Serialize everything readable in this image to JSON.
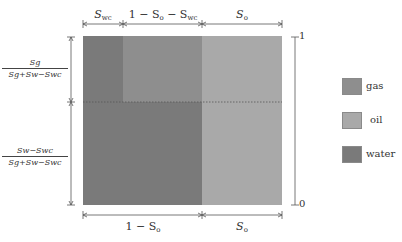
{
  "diagram": {
    "regions": [
      {
        "name": "water-top-left",
        "phase": "water"
      },
      {
        "name": "gas-top-middle",
        "phase": "gas"
      },
      {
        "name": "water-bottom-left",
        "phase": "water"
      },
      {
        "name": "oil-right",
        "phase": "oil"
      }
    ],
    "top_labels": {
      "swc": "S",
      "swc_sub": "wc",
      "middle_prefix": "1 − S",
      "middle_sub1": "o",
      "middle_mid": " − S",
      "middle_sub2": "wc",
      "so": "S",
      "so_sub": "o"
    },
    "bottom_labels": {
      "left_prefix": "1 − S",
      "left_sub": "o",
      "right": "S",
      "right_sub": "o"
    },
    "left_fractions": {
      "upper_num": "Sg",
      "upper_den": "Sg+Sw−Swc",
      "lower_num": "Sw−Swc",
      "lower_den": "Sg+Sw−Swc"
    },
    "right_axis": {
      "top_tick": "1",
      "bottom_tick": "0"
    },
    "legend": [
      {
        "label": "gas",
        "color": "#8e8e8e"
      },
      {
        "label": "oil",
        "color": "#a9a9a9"
      },
      {
        "label": "water",
        "color": "#7a7a7a"
      }
    ],
    "colors": {
      "gas": "#8e8e8e",
      "oil": "#a9a9a9",
      "water": "#7a7a7a",
      "dotted_line": "#5a5a5a"
    }
  }
}
